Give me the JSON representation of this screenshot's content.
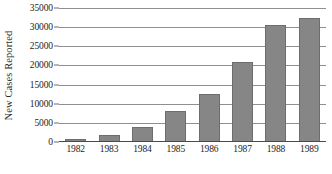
{
  "chart_data": {
    "type": "bar",
    "title": "",
    "subtitle": "",
    "xlabel": "",
    "ylabel": "New Cases Reported",
    "categories": [
      "1982",
      "1983",
      "1984",
      "1985",
      "1986",
      "1987",
      "1988",
      "1989"
    ],
    "values": [
      700,
      1800,
      4000,
      8000,
      12500,
      21000,
      30500,
      32500
    ],
    "series": [
      {
        "name": "New Cases Reported",
        "values": [
          700,
          1800,
          4000,
          8000,
          12500,
          21000,
          30500,
          32500
        ]
      }
    ],
    "ylim": [
      0,
      35000
    ],
    "ytick_labels": [
      "0",
      "5000",
      "10000",
      "15000",
      "20000",
      "25000",
      "30000",
      "35000"
    ],
    "ytick_values": [
      0,
      5000,
      10000,
      15000,
      20000,
      25000,
      30000,
      35000
    ],
    "ytick_step": 5000,
    "grid": true,
    "grid_axis": "y",
    "legend": false,
    "legend_position": "none",
    "bar_color": "#868686",
    "bar_edge_color": "#6d6d6d",
    "gridline_color": "#8f8f8f",
    "axis_color": "#4a4a4a",
    "text_color": "#1c1c1c",
    "background_color": "#ffffff",
    "annotations": []
  }
}
